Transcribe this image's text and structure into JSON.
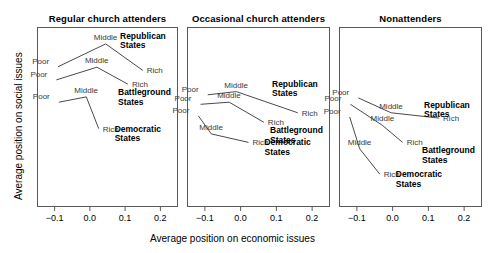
{
  "chart_data": {
    "type": "line",
    "title": "",
    "xlabel": "Average position on economic issues",
    "ylabel": "Average position on social issues",
    "xlim": [
      -0.15,
      0.25
    ],
    "ylim": [
      -0.22,
      0.12
    ],
    "grid": false,
    "legend_position": "inline-annotations",
    "xticks": [
      "-0.1",
      "0.0",
      "0.1",
      "0.2"
    ],
    "xtick_values": [
      -0.1,
      0.0,
      0.1,
      0.2
    ],
    "yticks": [],
    "panels": [
      {
        "title": "Regular church attenders",
        "series": [
          {
            "name": "Republican States",
            "points": [
              {
                "label": "Poor",
                "x": -0.09,
                "y": 0.045
              },
              {
                "label": "Middle",
                "x": 0.045,
                "y": 0.088
              },
              {
                "label": "Rich",
                "x": 0.15,
                "y": 0.038
              }
            ]
          },
          {
            "name": "Battleground States",
            "points": [
              {
                "label": "Poor",
                "x": -0.095,
                "y": 0.02
              },
              {
                "label": "Middle",
                "x": 0.02,
                "y": 0.044
              },
              {
                "label": "Rich",
                "x": 0.108,
                "y": 0.012
              }
            ]
          },
          {
            "name": "Democratic States",
            "points": [
              {
                "label": "Poor",
                "x": -0.088,
                "y": -0.022
              },
              {
                "label": "Middle",
                "x": -0.01,
                "y": -0.012
              },
              {
                "label": "Rich",
                "x": 0.025,
                "y": -0.072
              }
            ]
          }
        ]
      },
      {
        "title": "Occasional church attenders",
        "series": [
          {
            "name": "Republican States",
            "points": [
              {
                "label": "Poor",
                "x": -0.092,
                "y": -0.008
              },
              {
                "label": "Middle",
                "x": -0.012,
                "y": -0.002
              },
              {
                "label": "Rich",
                "x": 0.16,
                "y": -0.042
              }
            ]
          },
          {
            "name": "Battleground States",
            "points": [
              {
                "label": "Poor",
                "x": -0.112,
                "y": -0.026
              },
              {
                "label": "Middle",
                "x": -0.032,
                "y": -0.022
              },
              {
                "label": "Rich",
                "x": 0.065,
                "y": -0.06
              }
            ]
          },
          {
            "name": "Democratic States",
            "points": [
              {
                "label": "Poor",
                "x": -0.118,
                "y": -0.048
              },
              {
                "label": "Middle",
                "x": -0.082,
                "y": -0.082
              },
              {
                "label": "Rich",
                "x": 0.022,
                "y": -0.098
              }
            ]
          }
        ]
      },
      {
        "title": "Nonattenders",
        "series": [
          {
            "name": "Republican States",
            "points": [
              {
                "label": "Poor",
                "x": -0.096,
                "y": -0.014
              },
              {
                "label": "Middle",
                "x": -0.004,
                "y": -0.042
              },
              {
                "label": "Rich",
                "x": 0.13,
                "y": -0.052
              }
            ]
          },
          {
            "name": "Battleground States",
            "points": [
              {
                "label": "Poor",
                "x": -0.118,
                "y": -0.026
              },
              {
                "label": "Middle",
                "x": -0.028,
                "y": -0.066
              },
              {
                "label": "Rich",
                "x": 0.028,
                "y": -0.098
              }
            ]
          },
          {
            "name": "Democratic States",
            "points": [
              {
                "label": "Poor",
                "x": -0.12,
                "y": -0.05
              },
              {
                "label": "Middle",
                "x": -0.092,
                "y": -0.11
              },
              {
                "label": "Rich",
                "x": -0.036,
                "y": -0.158
              }
            ]
          }
        ]
      }
    ],
    "colors": {
      "line": "#4a4a4a",
      "frame": "#5a5a5a",
      "point_label": "#3a3a3a",
      "group_label": "#000000",
      "background": "#ffffff"
    }
  }
}
